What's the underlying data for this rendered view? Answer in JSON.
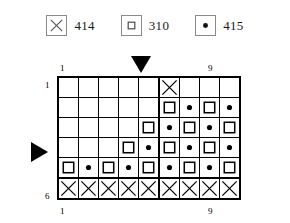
{
  "legend": {
    "entries": [
      {
        "symbol": "cross-symbol",
        "icon_name": "cross-icon",
        "label": "414"
      },
      {
        "symbol": "square-symbol",
        "icon_name": "square-icon",
        "label": "310"
      },
      {
        "symbol": "dot-symbol",
        "icon_name": "dot-icon",
        "label": "415"
      }
    ]
  },
  "markers": {
    "column_marker": {
      "icon_name": "triangle-down-icon",
      "points_to_column": 6
    },
    "row_marker": {
      "icon_name": "triangle-right-icon",
      "points_to_row": 4
    }
  },
  "axis": {
    "column_top_left": "1",
    "column_top_right": "9",
    "column_bottom_left": "1",
    "column_bottom_right": "9",
    "row_top_left": "1",
    "row_top_right": "1",
    "row_bottom_left": "6",
    "row_bottom_right": "6"
  },
  "colors": {
    "grid_line": "#000000",
    "background": "#ffffff",
    "symbol": "#000000",
    "legend_border": "#8a8a8a"
  },
  "chart_data": {
    "type": "heatmap",
    "title": "",
    "xlabel": "",
    "ylabel": "",
    "columns": 9,
    "rows": 6,
    "column_labels": [
      "1",
      "2",
      "3",
      "4",
      "5",
      "6",
      "7",
      "8",
      "9"
    ],
    "row_labels": [
      "1",
      "2",
      "3",
      "4",
      "5",
      "6"
    ],
    "symbol_key": {
      "x": "414",
      "s": "310",
      "d": "415",
      "": "empty"
    },
    "section_divider_after_column": 5,
    "section_divider_after_row": 5,
    "cells": [
      [
        "",
        "",
        "",
        "",
        "",
        "x",
        "",
        "",
        ""
      ],
      [
        "",
        "",
        "",
        "",
        "",
        "s",
        "d",
        "s",
        "d"
      ],
      [
        "",
        "",
        "",
        "",
        "s",
        "d",
        "s",
        "d",
        "s"
      ],
      [
        "",
        "",
        "",
        "s",
        "d",
        "s",
        "d",
        "s",
        "d"
      ],
      [
        "s",
        "d",
        "s",
        "d",
        "s",
        "d",
        "s",
        "d",
        "s"
      ],
      [
        "x",
        "x",
        "x",
        "x",
        "x",
        "x",
        "x",
        "x",
        "x"
      ]
    ]
  }
}
